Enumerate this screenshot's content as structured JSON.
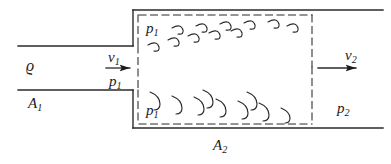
{
  "figure": {
    "type": "fluid-mechanics-schematic",
    "ink_color": "#1a1a1a",
    "background_color": "#ffffff"
  },
  "labels": {
    "density": {
      "symbol": "ϱ",
      "subscript": ""
    },
    "inlet_area": {
      "symbol": "A",
      "subscript": "1"
    },
    "outlet_area": {
      "symbol": "A",
      "subscript": "2"
    },
    "inlet_velocity": {
      "symbol": "v",
      "subscript": "1"
    },
    "outlet_velocity": {
      "symbol": "v",
      "subscript": "2"
    },
    "inlet_pressure_arrow": {
      "symbol": "p",
      "subscript": "1"
    },
    "pressure_top_left": {
      "symbol": "p",
      "subscript": "1"
    },
    "pressure_bottom_left": {
      "symbol": "p",
      "subscript": "1"
    },
    "outlet_pressure": {
      "symbol": "p",
      "subscript": "2"
    }
  },
  "geometry": {
    "inlet_pipe_top_y": 46,
    "inlet_pipe_bottom_y": 90,
    "expansion_x": 133,
    "outlet_top_y": 10,
    "outlet_bottom_y": 128,
    "control_volume_right_x": 312
  }
}
